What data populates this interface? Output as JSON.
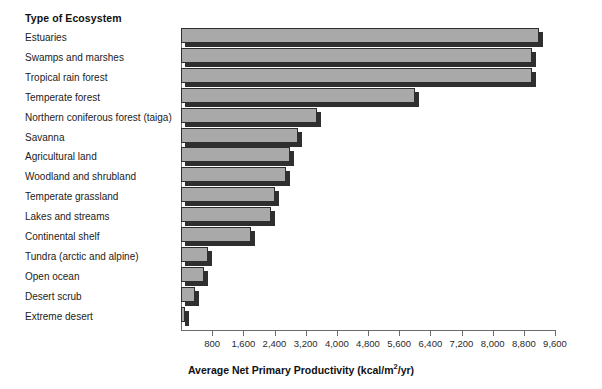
{
  "header": {
    "category_column_title": "Type of Ecosystem"
  },
  "axis": {
    "x_title_main": "Average Net Primary Productivity (kcal/m",
    "x_title_sup": "2",
    "x_title_tail": "/yr)",
    "x_title_full": "Average Net Primary Productivity (kcal/m2/yr)",
    "ticks": [
      "800",
      "1,600",
      "2,400",
      "3,200",
      "4,000",
      "4,800",
      "5,600",
      "6,400",
      "7,200",
      "8,000",
      "8,800",
      "9,600"
    ]
  },
  "colors": {
    "bar_face": "#a9a9a9",
    "bar_edge": "#2e2e2e",
    "bar_shadow": "#2f2f2f",
    "axis": "#6a6a6a",
    "text": "#1c1c1c",
    "background": "#ffffff"
  },
  "chart_data": {
    "type": "bar",
    "orientation": "horizontal",
    "title": "",
    "xlabel": "Average Net Primary Productivity (kcal/m2/yr)",
    "ylabel": "Type of Ecosystem",
    "xlim": [
      0,
      9600
    ],
    "grid": false,
    "legend": "none",
    "categories": [
      "Estuaries",
      "Swamps and marshes",
      "Tropical rain forest",
      "Temperate forest",
      "Northern coniferous forest (taiga)",
      "Savanna",
      "Agricultural land",
      "Woodland and shrubland",
      "Temperate grassland",
      "Lakes and streams",
      "Continental shelf",
      "Tundra (arctic and alpine)",
      "Open ocean",
      "Desert scrub",
      "Extreme desert"
    ],
    "values": [
      9200,
      9000,
      9000,
      6000,
      3500,
      3000,
      2800,
      2700,
      2400,
      2300,
      1800,
      700,
      600,
      350,
      100
    ],
    "tick_values": [
      800,
      1600,
      2400,
      3200,
      4000,
      4800,
      5600,
      6400,
      7200,
      8000,
      8800,
      9600
    ]
  }
}
